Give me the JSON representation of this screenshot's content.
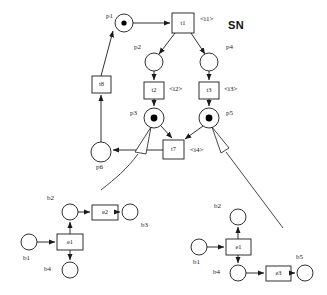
{
  "diagram": {
    "title": "SN",
    "background_color": "#ffffff",
    "stroke_color": "#1a1a1a",
    "token_color": "#000000"
  },
  "main_net": {
    "name": "SN",
    "places": [
      {
        "id": "p1",
        "label": "p1",
        "cx": 124,
        "cy": 23,
        "r": 9,
        "tokens": 1,
        "label_x": 106,
        "label_y": 14
      },
      {
        "id": "p2",
        "label": "p2",
        "cx": 154,
        "cy": 62,
        "r": 9,
        "tokens": 0,
        "label_x": 134,
        "label_y": 45
      },
      {
        "id": "p4",
        "label": "p4",
        "cx": 209,
        "cy": 62,
        "r": 9,
        "tokens": 0,
        "label_x": 226,
        "label_y": 45
      },
      {
        "id": "p3",
        "label": "p3",
        "cx": 154,
        "cy": 118,
        "r": 10,
        "tokens": 1,
        "label_x": 131,
        "label_y": 113
      },
      {
        "id": "p5",
        "label": "p5",
        "cx": 209,
        "cy": 118,
        "r": 10,
        "tokens": 1,
        "label_x": 226,
        "label_y": 113
      },
      {
        "id": "p6",
        "label": "p6",
        "cx": 101,
        "cy": 152,
        "r": 10,
        "tokens": 0,
        "label_x": 96,
        "label_y": 167
      }
    ],
    "transitions": [
      {
        "id": "t1",
        "label": "t1",
        "x": 172,
        "y": 13,
        "w": 22,
        "h": 20,
        "iface": "<i1>",
        "iface_x": 200,
        "iface_y": 16
      },
      {
        "id": "t2",
        "label": "t2",
        "x": 144,
        "y": 82,
        "w": 20,
        "h": 17,
        "iface": "<i2>",
        "iface_x": 169,
        "iface_y": 85
      },
      {
        "id": "t3",
        "label": "t3",
        "x": 199,
        "y": 82,
        "w": 20,
        "h": 17,
        "iface": "<i3>",
        "iface_x": 224,
        "iface_y": 85
      },
      {
        "id": "t7",
        "label": "t7",
        "x": 163,
        "y": 140,
        "w": 21,
        "h": 19,
        "iface": "<i4>",
        "iface_x": 190,
        "iface_y": 146
      },
      {
        "id": "t8",
        "label": "t8",
        "x": 92,
        "y": 76,
        "w": 19,
        "h": 17,
        "iface": "",
        "iface_x": 0,
        "iface_y": 0
      }
    ]
  },
  "subnet_left": {
    "places": [
      {
        "id": "b2",
        "label": "b2",
        "cx": 70,
        "cy": 212,
        "r": 8,
        "label_x": 47,
        "label_y": 197
      },
      {
        "id": "b3",
        "label": "b3",
        "cx": 130,
        "cy": 212,
        "r": 8,
        "label_x": 140,
        "label_y": 224
      },
      {
        "id": "b1",
        "label": "b1",
        "cx": 29,
        "cy": 242,
        "r": 8,
        "label_x": 23,
        "label_y": 257
      },
      {
        "id": "b4",
        "label": "b4",
        "cx": 70,
        "cy": 270,
        "r": 8,
        "label_x": 44,
        "label_y": 268
      }
    ],
    "transitions": [
      {
        "id": "e1",
        "label": "e1",
        "x": 57,
        "y": 234,
        "w": 26,
        "h": 16
      },
      {
        "id": "e2",
        "label": "e2",
        "x": 92,
        "y": 205,
        "w": 26,
        "h": 15
      }
    ]
  },
  "subnet_right": {
    "places": [
      {
        "id": "b2",
        "label": "b2",
        "cx": 238,
        "cy": 217,
        "r": 8,
        "label_x": 214,
        "label_y": 205
      },
      {
        "id": "b1",
        "label": "b1",
        "cx": 199,
        "cy": 247,
        "r": 8,
        "label_x": 193,
        "label_y": 261
      },
      {
        "id": "b4",
        "label": "b4",
        "cx": 238,
        "cy": 273,
        "r": 8,
        "label_x": 213,
        "label_y": 272
      },
      {
        "id": "b5",
        "label": "b5",
        "cx": 305,
        "cy": 273,
        "r": 8,
        "label_x": 296,
        "label_y": 256
      }
    ],
    "transitions": [
      {
        "id": "e1",
        "label": "e1",
        "x": 226,
        "y": 239,
        "w": 25,
        "h": 16
      },
      {
        "id": "e3",
        "label": "e3",
        "x": 266,
        "y": 266,
        "w": 25,
        "h": 15
      }
    ]
  }
}
